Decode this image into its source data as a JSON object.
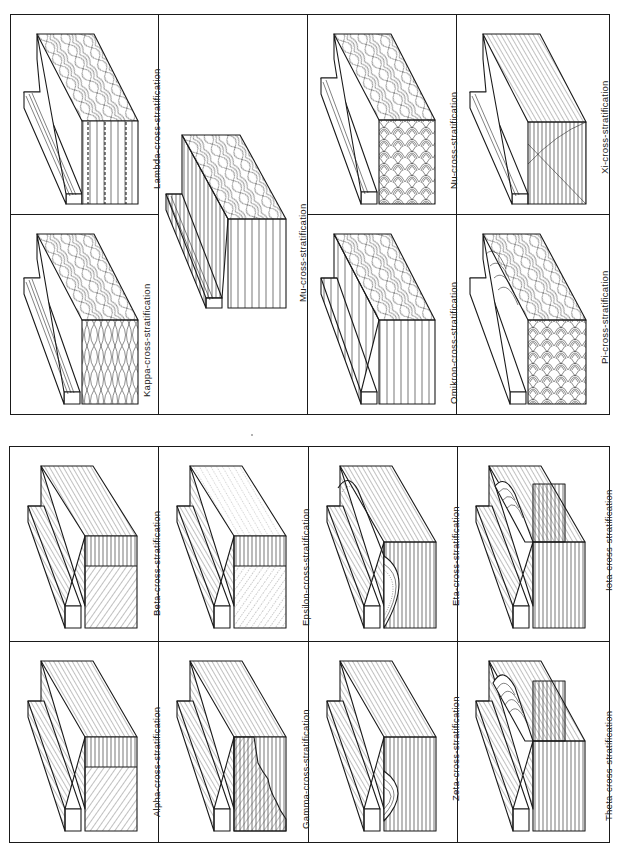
{
  "figure": {
    "type": "block-diagram-plate",
    "orientation": "rotated-90-ccw",
    "line_color": "#1a1a1a",
    "background": "#ffffff"
  },
  "top_panel": {
    "cells": [
      {
        "id": "lambda",
        "label": "Lambda-cross-stratification",
        "pattern": "trough-dashed"
      },
      {
        "id": "kappa",
        "label": "Kappa-cross-stratification",
        "pattern": "lenticular"
      },
      {
        "id": "mu",
        "label": "Mu-cross-stratification",
        "pattern": "scoop-vertical"
      },
      {
        "id": "xi",
        "label": "Xi-cross-stratification",
        "pattern": "large-trough"
      },
      {
        "id": "nu",
        "label": "Nu-cross-stratification",
        "pattern": "festoon"
      },
      {
        "id": "pi",
        "label": "Pi-cross-stratification",
        "pattern": "arc-festoon"
      },
      {
        "id": "omikron",
        "label": "Omikron-cross-stratification",
        "pattern": "scoop-vertical-wide"
      }
    ]
  },
  "bottom_panel": {
    "cells": [
      {
        "id": "beta",
        "label": "Beta-cross-stratification",
        "pattern": "planar-beta"
      },
      {
        "id": "alpha",
        "label": "Alpha-cross-stratification",
        "pattern": "planar-alpha"
      },
      {
        "id": "epsilon",
        "label": "Epsilon-cross-stratification",
        "pattern": "planar-dotted"
      },
      {
        "id": "gamma",
        "label": "Gamma-cross-stratification",
        "pattern": "planar-irregular"
      },
      {
        "id": "eta",
        "label": "Eta-cross-stratification",
        "pattern": "trough-dotted"
      },
      {
        "id": "zeta",
        "label": "Zeta-cross-stratification",
        "pattern": "trough-single"
      },
      {
        "id": "iota",
        "label": "Iota-cross-stratification",
        "pattern": "trough-offset"
      },
      {
        "id": "theta",
        "label": "Theta-cross-stratification",
        "pattern": "trough-offset-arcs"
      }
    ]
  }
}
